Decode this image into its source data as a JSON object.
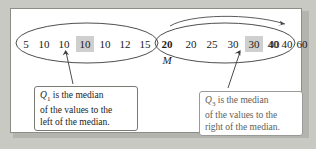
{
  "figure": {
    "type": "statistics-quartile-diagram",
    "background_color": "#c9c9c4",
    "panel_color": "#ffffff",
    "border_color": "#8d8d88"
  },
  "dataset": {
    "left_group": {
      "values": [
        "5",
        "10",
        "10",
        "10",
        "10",
        "12",
        "15"
      ],
      "highlight_index": 3,
      "highlight_color": "#cfcfcf"
    },
    "median": {
      "value": "20",
      "label": "M"
    },
    "right_group": {
      "values": [
        "20",
        "25",
        "30",
        "30",
        "40",
        "40",
        "60"
      ],
      "highlight_index": 3,
      "highlight_color": "#cfcfcf"
    }
  },
  "callouts": {
    "left": {
      "symbol": "Q",
      "subscript": "1",
      "line1_rest": " is the median",
      "line2": "of the values to the",
      "line3": "left of the median.",
      "text_color": "#1b1b1b",
      "border_color": "#7a7a75"
    },
    "right": {
      "symbol": "Q",
      "subscript": "3",
      "line1_rest": " is the median",
      "line2": "of the values to the",
      "line3": "right of the median.",
      "text_color": "#5e5e5a",
      "border_color": "#9a9a96"
    }
  }
}
